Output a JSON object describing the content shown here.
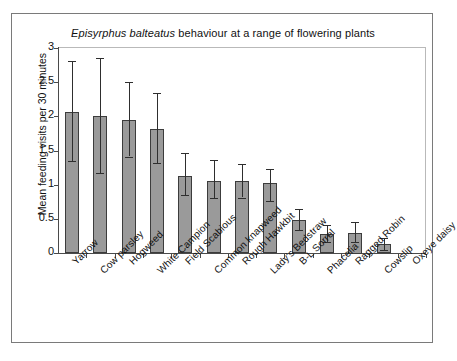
{
  "figure": {
    "title_species": "Episyrphus balteatus",
    "title_rest": " behaviour at a range of flowering plants",
    "title_full": "Episyrphus balteatus behaviour at a range of flowering plants"
  },
  "chart_data": {
    "type": "bar",
    "title": "Episyrphus balteatus behaviour at a range of flowering plants",
    "xlabel": "",
    "ylabel": "Mean feeding visits per 30 minutes",
    "ylim": [
      0,
      3
    ],
    "yticks": [
      "0",
      "0.5",
      "1",
      "1.5",
      "2",
      "2.5",
      "3"
    ],
    "ytick_values": [
      0,
      0.5,
      1,
      1.5,
      2,
      2.5,
      3
    ],
    "grid": false,
    "legend": null,
    "error_bars": "symmetric-ish 95% CI / SE whiskers with caps",
    "bar_color": "#9a9a9a",
    "bar_edge_color": "#3c3c3c",
    "categories": [
      "Yarrow",
      "Cow parsley",
      "Hogweed",
      "White Campion",
      "Field Scabious",
      "Common knapweed",
      "Rough Hawkbit",
      "Lady's Bedstraw",
      "B-L Sorrel",
      "Phacelia",
      "Ragged Robin",
      "Cowslip",
      "Oxeye daisy"
    ],
    "values": [
      2.07,
      2.01,
      1.94,
      1.81,
      1.13,
      1.05,
      1.06,
      1.02,
      0.49,
      0.28,
      0.3,
      0.13,
      0.0
    ],
    "err_low": [
      1.34,
      1.17,
      1.41,
      1.32,
      0.85,
      0.8,
      0.81,
      0.76,
      0.33,
      0.16,
      0.16,
      0.05,
      0.0
    ],
    "err_high": [
      2.81,
      2.85,
      2.5,
      2.34,
      1.47,
      1.36,
      1.3,
      1.23,
      0.64,
      0.41,
      0.45,
      0.22,
      0.0
    ]
  }
}
